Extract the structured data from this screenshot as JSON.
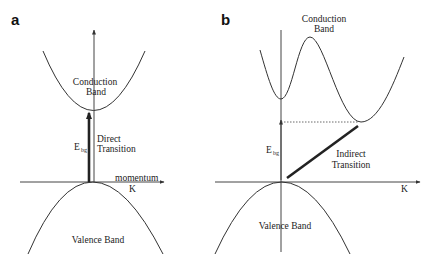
{
  "figure": {
    "panel_a": {
      "letter": "a",
      "conduction_band_line1": "Conduction",
      "conduction_band_line2": "Band",
      "gap_label": "E",
      "gap_subscript": "bg",
      "transition_line1": "Direct",
      "transition_line2": "Transition",
      "axis_label_top": "momentum",
      "axis_label": "K",
      "valence_band": "Valence Band"
    },
    "panel_b": {
      "letter": "b",
      "conduction_band_line1": "Conduction",
      "conduction_band_line2": "Band",
      "gap_label": "E",
      "gap_subscript": "bg",
      "transition_line1": "Indirect",
      "transition_line2": "Transition",
      "axis_label": "K",
      "valence_band": "Valence Band"
    },
    "colors": {
      "line": "#333333",
      "background": "#ffffff"
    }
  }
}
